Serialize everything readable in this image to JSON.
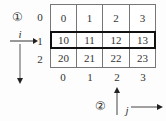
{
  "diagram": {
    "markers": {
      "row_marker": "①",
      "col_marker": "②"
    },
    "axis_labels": {
      "row_axis": "i",
      "col_axis": "j"
    },
    "row_indices": [
      "0",
      "1",
      "2"
    ],
    "col_indices": [
      "0",
      "1",
      "2",
      "3"
    ],
    "cells": [
      [
        "0",
        "1",
        "2",
        "3"
      ],
      [
        "10",
        "11",
        "12",
        "13"
      ],
      [
        "20",
        "21",
        "22",
        "23"
      ]
    ],
    "highlighted_row": 1
  }
}
